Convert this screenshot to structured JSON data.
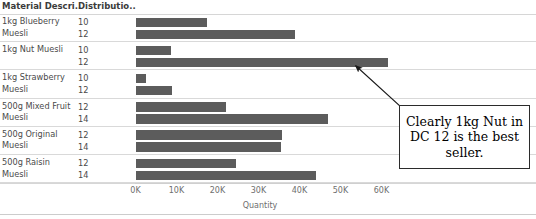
{
  "header": {
    "material_col": "Material Descri..",
    "distribution_col": "Distributio.."
  },
  "axis": {
    "title": "Quantity",
    "ticks": [
      "0K",
      "10K",
      "20K",
      "30K",
      "40K",
      "50K",
      "60K"
    ]
  },
  "annotation": {
    "text": "Clearly 1kg Nut in DC 12 is the best seller."
  },
  "colors": {
    "bar": "#5c5c5c",
    "grid": "#d9d9d9",
    "text": "#4a4a4a",
    "annotation_border": "#2b2b2b"
  },
  "chart_data": {
    "type": "bar",
    "title": "",
    "xlabel": "Quantity",
    "ylabel": "",
    "xlim": [
      0,
      62000
    ],
    "grid": false,
    "orientation": "horizontal",
    "group_field": "Material Description",
    "sub_field": "Distribution Center",
    "groups": [
      {
        "label": "1kg Blueberry Muesli",
        "rows": [
          {
            "dc": "10",
            "value": 17500
          },
          {
            "dc": "12",
            "value": 39000
          }
        ]
      },
      {
        "label": "1kg Nut Muesli",
        "rows": [
          {
            "dc": "10",
            "value": 8700
          },
          {
            "dc": "12",
            "value": 61500
          }
        ]
      },
      {
        "label": "1kg Strawberry Muesli",
        "rows": [
          {
            "dc": "10",
            "value": 2600
          },
          {
            "dc": "12",
            "value": 9000
          }
        ]
      },
      {
        "label": "500g Mixed Fruit Muesli",
        "rows": [
          {
            "dc": "12",
            "value": 22000
          },
          {
            "dc": "14",
            "value": 47000
          }
        ]
      },
      {
        "label": "500g Original Muesli",
        "rows": [
          {
            "dc": "12",
            "value": 35800
          },
          {
            "dc": "14",
            "value": 35500
          }
        ]
      },
      {
        "label": "500g Raisin Muesli",
        "rows": [
          {
            "dc": "12",
            "value": 24500
          },
          {
            "dc": "14",
            "value": 44000
          }
        ]
      }
    ]
  }
}
